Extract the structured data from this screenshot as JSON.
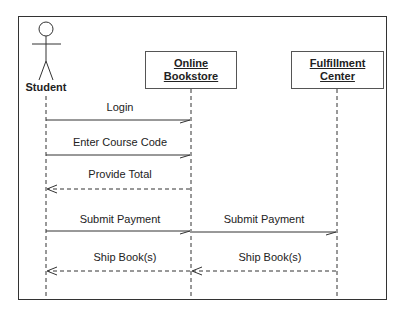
{
  "diagram": {
    "type": "UML sequence diagram",
    "actor": {
      "name": "Student"
    },
    "objects": [
      {
        "line1": "Online",
        "line2": "Bookstore"
      },
      {
        "line1": "Fulfillment",
        "line2": "Center"
      }
    ],
    "messages": [
      {
        "label": "Login",
        "from": "Student",
        "to": "Online Bookstore",
        "style": "solid"
      },
      {
        "label": "Enter Course Code",
        "from": "Student",
        "to": "Online Bookstore",
        "style": "solid"
      },
      {
        "label": "Provide Total",
        "from": "Online Bookstore",
        "to": "Student",
        "style": "dashed"
      },
      {
        "label": "Submit Payment",
        "from": "Student",
        "to": "Online Bookstore",
        "style": "solid"
      },
      {
        "label": "Submit Payment",
        "from": "Online Bookstore",
        "to": "Fulfillment Center",
        "style": "solid"
      },
      {
        "label": "Ship Book(s)",
        "from": "Online Bookstore",
        "to": "Student",
        "style": "dashed"
      },
      {
        "label": "Ship Book(s)",
        "from": "Fulfillment Center",
        "to": "Online Bookstore",
        "style": "dashed"
      }
    ]
  }
}
